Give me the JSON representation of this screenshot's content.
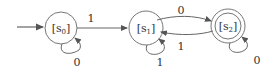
{
  "diagram": {
    "type": "finite-state-automaton",
    "states": [
      {
        "id": "s0",
        "label": "[s",
        "sub": "0",
        "close": "]",
        "start": true,
        "accepting": false
      },
      {
        "id": "s1",
        "label": "[s",
        "sub": "1",
        "close": "]",
        "start": false,
        "accepting": false
      },
      {
        "id": "s2",
        "label": "[s",
        "sub": "2",
        "close": "]",
        "start": false,
        "accepting": true
      }
    ],
    "transitions": [
      {
        "from": "s0",
        "to": "s0",
        "label": "0"
      },
      {
        "from": "s0",
        "to": "s1",
        "label": "1"
      },
      {
        "from": "s1",
        "to": "s1",
        "label": "1"
      },
      {
        "from": "s1",
        "to": "s2",
        "label": "0"
      },
      {
        "from": "s2",
        "to": "s1",
        "label": "1"
      },
      {
        "from": "s2",
        "to": "s2",
        "label": "0"
      }
    ]
  }
}
